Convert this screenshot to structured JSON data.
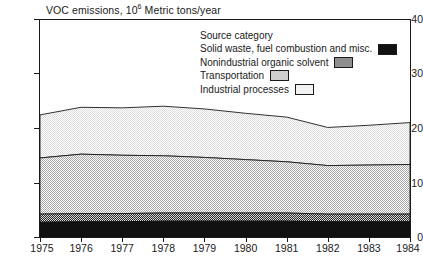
{
  "chart_data": {
    "type": "area",
    "stacked": true,
    "title_prefix": "VOC emissions, 10",
    "title_exponent": "6",
    "title_suffix": " Metric tons/year",
    "xlabel": "",
    "ylabel": "VOC emissions, 10^6 Metric tons/year",
    "x": [
      1975,
      1976,
      1977,
      1978,
      1979,
      1980,
      1981,
      1982,
      1983,
      1984
    ],
    "xticklabels": [
      "1975",
      "1976",
      "1977",
      "1978",
      "1979",
      "1980",
      "1981",
      "1982",
      "1983",
      "1984"
    ],
    "yticks": [
      0,
      10,
      20,
      30,
      40
    ],
    "yticklabels": [
      "0",
      "10",
      "20",
      "30",
      "40"
    ],
    "ylim": [
      0,
      40
    ],
    "xlim": [
      1975,
      1984
    ],
    "grid": false,
    "legend_position": "upper-right-inside",
    "legend_title": "Source category",
    "series": [
      {
        "name": "Industrial processes",
        "color": "#f2f2f2",
        "values": [
          7.9,
          8.6,
          8.7,
          9.1,
          8.9,
          8.5,
          8.2,
          7.0,
          7.3,
          7.7
        ]
      },
      {
        "name": "Transportation",
        "color": "#cfcfcf",
        "values": [
          10.3,
          10.9,
          10.7,
          10.5,
          10.2,
          9.8,
          9.4,
          8.9,
          9.0,
          9.1
        ]
      },
      {
        "name": "Nonindustrial organic solvent",
        "color": "#8e8e8e",
        "values": [
          1.5,
          1.5,
          1.5,
          1.5,
          1.5,
          1.5,
          1.5,
          1.4,
          1.4,
          1.4
        ]
      },
      {
        "name": "Solid waste, fuel combustion and misc.",
        "color": "#111111",
        "values": [
          2.7,
          2.8,
          2.8,
          2.9,
          2.9,
          2.9,
          2.9,
          2.8,
          2.8,
          2.8
        ]
      }
    ],
    "totals": [
      22.4,
      23.8,
      23.7,
      24.0,
      23.5,
      22.7,
      22.0,
      20.1,
      20.5,
      21.0
    ]
  },
  "legend": {
    "title": "Source category",
    "items": [
      {
        "label": "Solid waste, fuel combustion and misc.",
        "swatch": "solid"
      },
      {
        "label": "Nonindustrial organic solvent",
        "swatch": "noni"
      },
      {
        "label": "Transportation",
        "swatch": "tran"
      },
      {
        "label": "Industrial processes",
        "swatch": "indu"
      }
    ]
  },
  "axes": {
    "y_labels": [
      "40",
      "30",
      "20",
      "10",
      "0"
    ],
    "x_labels": [
      "1975",
      "1976",
      "1977",
      "1978",
      "1979",
      "1980",
      "1981",
      "1982",
      "1983",
      "1984"
    ]
  }
}
